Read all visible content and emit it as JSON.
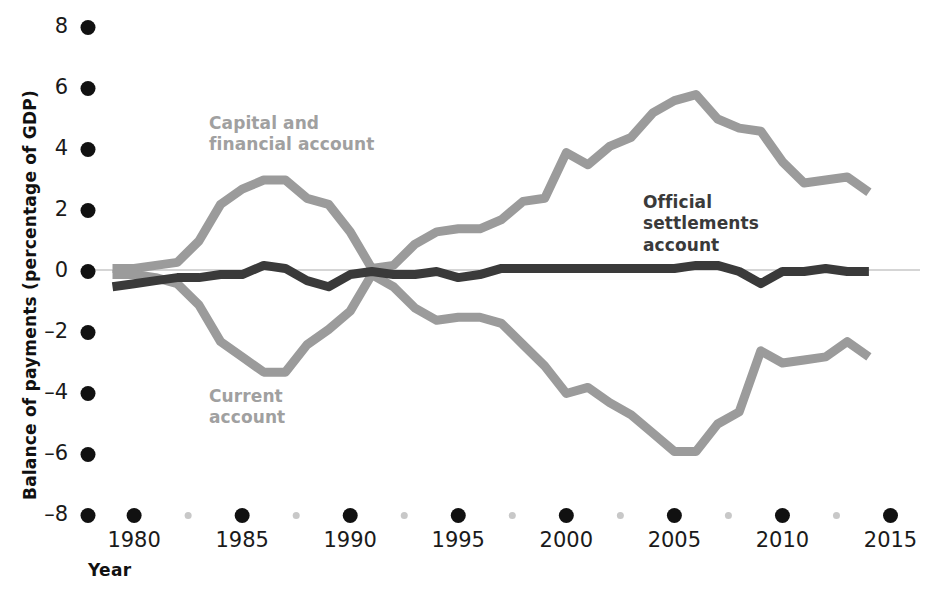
{
  "chart_data": {
    "type": "line",
    "title": "",
    "xlabel": "Year",
    "ylabel": "Balance of payments (percentage of GDP)",
    "xlim": [
      1979,
      2015
    ],
    "ylim": [
      -8,
      8
    ],
    "grid": false,
    "legend_position": "inline-annotations",
    "x_ticks": [
      "1980",
      "1985",
      "1990",
      "1995",
      "2000",
      "2005",
      "2010",
      "2015"
    ],
    "x_tick_values": [
      1980,
      1985,
      1990,
      1995,
      2000,
      2005,
      2010,
      2015
    ],
    "x_minor_tick_values": [
      1982.5,
      1987.5,
      1992.5,
      1997.5,
      2002.5,
      2007.5,
      2012.5
    ],
    "y_ticks": [
      "8",
      "6",
      "4",
      "2",
      "0",
      "–2",
      "–4",
      "–6",
      "–8"
    ],
    "y_tick_values": [
      8,
      6,
      4,
      2,
      0,
      -2,
      -4,
      -6,
      -8
    ],
    "zero_line": 0,
    "x": [
      1979,
      1980,
      1981,
      1982,
      1983,
      1984,
      1985,
      1986,
      1987,
      1988,
      1989,
      1990,
      1991,
      1992,
      1993,
      1994,
      1995,
      1996,
      1997,
      1998,
      1999,
      2000,
      2001,
      2002,
      2003,
      2004,
      2005,
      2006,
      2007,
      2008,
      2009,
      2010,
      2011,
      2012,
      2013,
      2014
    ],
    "series": [
      {
        "name": "Capital and financial account",
        "color": "#9b9b9b",
        "values": [
          0.1,
          0.1,
          0.2,
          0.3,
          1.0,
          2.2,
          2.7,
          3.0,
          3.0,
          2.4,
          2.2,
          1.3,
          0.1,
          0.2,
          0.9,
          1.3,
          1.4,
          1.4,
          1.7,
          2.3,
          2.4,
          3.9,
          3.5,
          4.1,
          4.4,
          5.2,
          5.6,
          5.8,
          5.0,
          4.7,
          4.6,
          3.6,
          2.9,
          3.0,
          3.1,
          2.6
        ]
      },
      {
        "name": "Current account",
        "color": "#9b9b9b",
        "values": [
          -0.1,
          -0.1,
          -0.2,
          -0.4,
          -1.1,
          -2.3,
          -2.8,
          -3.3,
          -3.3,
          -2.4,
          -1.9,
          -1.3,
          -0.1,
          -0.5,
          -1.2,
          -1.6,
          -1.5,
          -1.5,
          -1.7,
          -2.4,
          -3.1,
          -4.0,
          -3.8,
          -4.3,
          -4.7,
          -5.3,
          -5.9,
          -5.9,
          -5.0,
          -4.6,
          -2.6,
          -3.0,
          -2.9,
          -2.8,
          -2.3,
          -2.8
        ]
      },
      {
        "name": "Official settlements account",
        "color": "#3a3a3a",
        "values": [
          -0.5,
          -0.4,
          -0.3,
          -0.2,
          -0.2,
          -0.1,
          -0.1,
          0.2,
          0.1,
          -0.3,
          -0.5,
          -0.1,
          0.0,
          -0.1,
          -0.1,
          0.0,
          -0.2,
          -0.1,
          0.1,
          0.1,
          0.1,
          0.1,
          0.1,
          0.1,
          0.1,
          0.1,
          0.1,
          0.2,
          0.2,
          0.0,
          -0.4,
          0.0,
          0.0,
          0.1,
          0.0,
          0.0
        ]
      }
    ],
    "annotations": [
      {
        "name": "capital-and-financial-account",
        "text": "Capital and\nfinancial account",
        "color": "#a0a0a0"
      },
      {
        "name": "current-account",
        "text": "Current\naccount",
        "color": "#a0a0a0"
      },
      {
        "name": "official-settlements-account",
        "text": "Official\nsettlements\naccount",
        "color": "#3a3a3a"
      }
    ]
  },
  "axes": {
    "y_title": "Balance of payments (percentage of GDP)",
    "x_title": "Year",
    "y_tick_labels": [
      "8",
      "6",
      "4",
      "2",
      "0",
      "–2",
      "–4",
      "–6",
      "–8"
    ],
    "x_tick_labels": [
      "1980",
      "1985",
      "1990",
      "1995",
      "2000",
      "2005",
      "2010",
      "2015"
    ]
  },
  "labels": {
    "capital": "Capital and\nfinancial account",
    "current": "Current\naccount",
    "official": "Official\nsettlements\naccount"
  },
  "colors": {
    "gray_series": "#9b9b9b",
    "dark_series": "#3a3a3a",
    "label_gray": "#a0a0a0",
    "tick_dot_major": "#111111",
    "tick_dot_minor": "#c8c8c8",
    "zero_rule": "#d0d0d0",
    "background": "#ffffff"
  }
}
